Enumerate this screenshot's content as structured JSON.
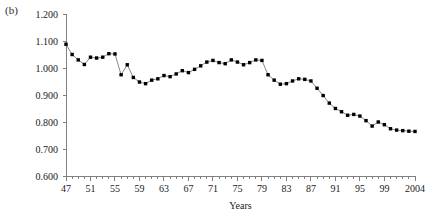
{
  "figure": {
    "panel_label": "(b)",
    "background_color": "#ffffff"
  },
  "axis_title": {
    "x": "Years"
  },
  "chart_data": {
    "type": "line",
    "title": "",
    "subtitle": "",
    "xlabel": "Years",
    "ylabel": "",
    "ylim": [
      0.6,
      1.2
    ],
    "ytick_step": 0.1,
    "ytick_labels": [
      "1.200",
      "1.100",
      "1.000",
      "0.900",
      "0.800",
      "0.700",
      "0.600"
    ],
    "ytick_values": [
      1.2,
      1.1,
      1.0,
      0.9,
      0.8,
      0.7,
      0.6
    ],
    "xlim": [
      1947,
      2004
    ],
    "xtick_labels": [
      "47",
      "51",
      "55",
      "59",
      "63",
      "67",
      "71",
      "75",
      "79",
      "83",
      "87",
      "91",
      "95",
      "99",
      "2004"
    ],
    "xtick_values": [
      1947,
      1951,
      1955,
      1959,
      1963,
      1967,
      1971,
      1975,
      1979,
      1983,
      1987,
      1991,
      1995,
      1999,
      2004
    ],
    "minor_tick_every": 1,
    "grid": false,
    "legend": null,
    "marker": "filled-square",
    "marker_color": "#000000",
    "line_color": "#555555",
    "x": [
      1947,
      1948,
      1949,
      1950,
      1951,
      1952,
      1953,
      1954,
      1955,
      1956,
      1957,
      1958,
      1959,
      1960,
      1961,
      1962,
      1963,
      1964,
      1965,
      1966,
      1967,
      1968,
      1969,
      1970,
      1971,
      1972,
      1973,
      1974,
      1975,
      1976,
      1977,
      1978,
      1979,
      1980,
      1981,
      1982,
      1983,
      1984,
      1985,
      1986,
      1987,
      1988,
      1989,
      1990,
      1991,
      1992,
      1993,
      1994,
      1995,
      1996,
      1997,
      1998,
      1999,
      2000,
      2001,
      2002,
      2003,
      2004
    ],
    "values": [
      1.088,
      1.05,
      1.03,
      1.013,
      1.04,
      1.037,
      1.04,
      1.053,
      1.052,
      0.975,
      1.012,
      0.965,
      0.948,
      0.942,
      0.955,
      0.96,
      0.972,
      0.968,
      0.978,
      0.99,
      0.983,
      0.995,
      1.008,
      1.022,
      1.028,
      1.02,
      1.016,
      1.03,
      1.022,
      1.012,
      1.02,
      1.03,
      1.028,
      0.975,
      0.955,
      0.94,
      0.942,
      0.952,
      0.96,
      0.958,
      0.952,
      0.925,
      0.898,
      0.87,
      0.85,
      0.838,
      0.825,
      0.828,
      0.822,
      0.805,
      0.785,
      0.8,
      0.79,
      0.775,
      0.77,
      0.768,
      0.766,
      0.765
    ],
    "series": [
      {
        "name": "series-1",
        "values": [
          1.088,
          1.05,
          1.03,
          1.013,
          1.04,
          1.037,
          1.04,
          1.053,
          1.052,
          0.975,
          1.012,
          0.965,
          0.948,
          0.942,
          0.955,
          0.96,
          0.972,
          0.968,
          0.978,
          0.99,
          0.983,
          0.995,
          1.008,
          1.022,
          1.028,
          1.02,
          1.016,
          1.03,
          1.022,
          1.012,
          1.02,
          1.03,
          1.028,
          0.975,
          0.955,
          0.94,
          0.942,
          0.952,
          0.96,
          0.958,
          0.952,
          0.925,
          0.898,
          0.87,
          0.85,
          0.838,
          0.825,
          0.828,
          0.822,
          0.805,
          0.785,
          0.8,
          0.79,
          0.775,
          0.77,
          0.768,
          0.766,
          0.765
        ]
      }
    ]
  }
}
